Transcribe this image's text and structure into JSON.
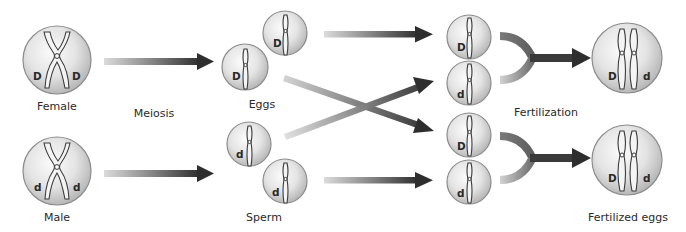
{
  "diagram": {
    "colors": {
      "background": "#ffffff",
      "cell_light": "#f7f7f7",
      "cell_dark": "#b5b5b5",
      "cell_stroke": "#8c8c8c",
      "arrow_start": "#d9d9d9",
      "arrow_end": "#2e2e2e",
      "text": "#2a2a2a"
    },
    "labels": {
      "female": "Female",
      "male": "Male",
      "meiosis": "Meiosis",
      "eggs": "Eggs",
      "sperm": "Sperm",
      "fertilization": "Fertilization",
      "fertilized_eggs": "Fertilized eggs"
    },
    "parents": [
      {
        "name": "Female",
        "alleles": [
          "D",
          "D"
        ]
      },
      {
        "name": "Male",
        "alleles": [
          "d",
          "d"
        ]
      }
    ],
    "gametes": {
      "eggs": [
        {
          "allele": "D"
        },
        {
          "allele": "D"
        }
      ],
      "sperm": [
        {
          "allele": "d"
        },
        {
          "allele": "d"
        }
      ]
    },
    "pairings": [
      {
        "allele": "D"
      },
      {
        "allele": "d"
      },
      {
        "allele": "D"
      },
      {
        "allele": "d"
      }
    ],
    "offspring": [
      {
        "alleles": [
          "D",
          "d"
        ]
      },
      {
        "alleles": [
          "D",
          "d"
        ]
      }
    ]
  }
}
